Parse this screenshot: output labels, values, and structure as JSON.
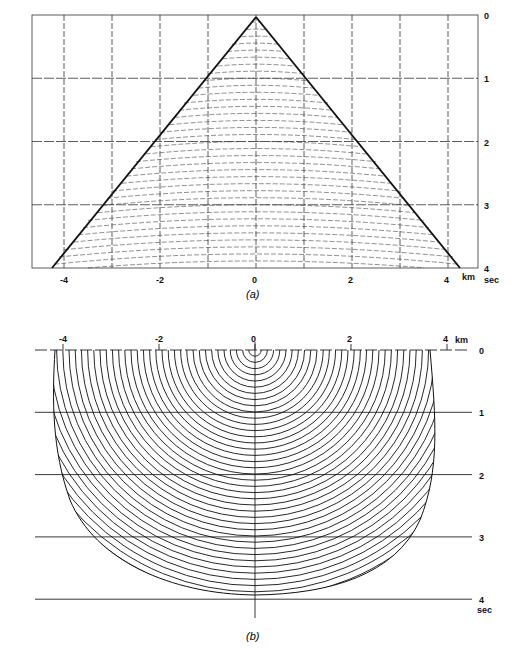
{
  "figure_a": {
    "caption": "(a)",
    "x_ticks": [
      "-4",
      "-2",
      "0",
      "2",
      "4"
    ],
    "x_unit": "km",
    "y_ticks": [
      "0",
      "1",
      "2",
      "3",
      "4"
    ],
    "y_unit": "sec",
    "description": "Diffraction hyperbola envelopes with migration arcs inside a triangular wedge on a time-distance grid"
  },
  "figure_b": {
    "caption": "(b)",
    "x_ticks": [
      "-4",
      "-2",
      "0",
      "2",
      "4"
    ],
    "x_unit": "km",
    "y_ticks": [
      "0",
      "1",
      "2",
      "3",
      "4"
    ],
    "y_unit": "sec",
    "description": "Concentric semicircular wavefronts centered at x=0 truncated to a bowl-shaped aperture"
  },
  "colors": {
    "ink": "#1a1a1a",
    "grid": "#333333",
    "background": "#ffffff"
  }
}
